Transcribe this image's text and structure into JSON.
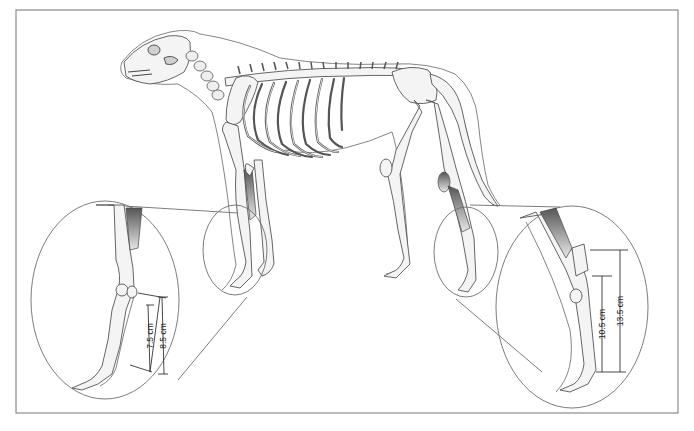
{
  "figure": {
    "frame_color": "#8a8a8a",
    "line_color": "#555555"
  },
  "insets": {
    "forelimb": {
      "label": "forelimb-detail",
      "measurements": [
        {
          "label": "7.5 cm",
          "value_cm": 7.5
        },
        {
          "label": "8.5 cm",
          "value_cm": 8.5
        }
      ]
    },
    "hindlimb": {
      "label": "hindlimb-detail",
      "measurements": [
        {
          "label": "10.5 cm",
          "value_cm": 10.5
        },
        {
          "label": "13.5 cm",
          "value_cm": 13.5
        }
      ]
    }
  }
}
